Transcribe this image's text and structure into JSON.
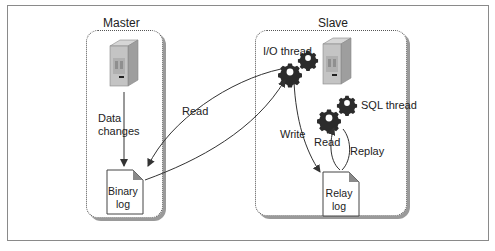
{
  "diagram": {
    "master": {
      "title": "Master",
      "edge_label_line1": "Data",
      "edge_label_line2": "changes",
      "doc_line1": "Binary",
      "doc_line2": "log"
    },
    "slave": {
      "title": "Slave",
      "io_thread_label": "I/O thread",
      "sql_thread_label": "SQL thread",
      "doc_line1": "Relay",
      "doc_line2": "log",
      "write_label": "Write",
      "read_label": "Read",
      "replay_label": "Replay"
    },
    "cross_read_label": "Read",
    "colors": {
      "server_body": "#b0b0b0",
      "server_face": "#c8c8c8",
      "gear": "#2b2b2b",
      "line": "#333333",
      "doc_fold": "#8a8a8a"
    }
  }
}
